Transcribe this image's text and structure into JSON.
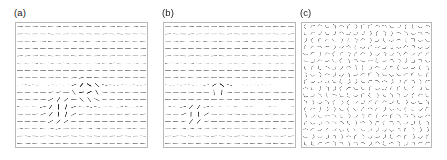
{
  "figure": {
    "type": "multi-panel-vector-field-figure",
    "width": 447,
    "height": 160,
    "background_color": "#ffffff",
    "panel_count": 3
  },
  "panels": [
    {
      "label": "(a)",
      "label_x": 14,
      "label_y": 7,
      "frame_x": 15,
      "frame_y": 22,
      "frame_w": 133,
      "frame_h": 126,
      "state": "ordered-nematic-with-defect-pair",
      "glyph": "dash",
      "base_angle_deg": 0,
      "angle_noise_deg": 7,
      "cols": 17,
      "rows": 17,
      "seed": 1741,
      "defects": [
        {
          "cx": 0.545,
          "cy": 0.525,
          "radius": 0.085,
          "strength": 78,
          "kind": "dark-cluster"
        },
        {
          "cx": 0.335,
          "cy": 0.7,
          "radius": 0.1,
          "strength": 62,
          "kind": "tilted-streak"
        }
      ]
    },
    {
      "label": "(b)",
      "label_x": 162,
      "label_y": 7,
      "frame_x": 163,
      "frame_y": 22,
      "frame_w": 133,
      "frame_h": 126,
      "state": "ordered-nematic-with-defect-pair",
      "glyph": "dash",
      "base_angle_deg": 0,
      "angle_noise_deg": 6,
      "cols": 17,
      "rows": 17,
      "seed": 9043,
      "defects": [
        {
          "cx": 0.425,
          "cy": 0.52,
          "radius": 0.055,
          "strength": 80,
          "kind": "dark-cluster"
        },
        {
          "cx": 0.235,
          "cy": 0.735,
          "radius": 0.075,
          "strength": 66,
          "kind": "tilted-streak"
        }
      ]
    },
    {
      "label": "(c)",
      "label_x": 300,
      "label_y": 7,
      "frame_x": 301,
      "frame_y": 22,
      "frame_w": 131,
      "frame_h": 126,
      "state": "disordered-isotropic",
      "glyph": "chevron",
      "base_angle_deg": null,
      "angle_noise_deg": 180,
      "cols": 18,
      "rows": 18,
      "seed": 2677,
      "defects": []
    }
  ],
  "style": {
    "frame_stroke": "#b9b9b9",
    "glyph_stroke": "#7a7a7a",
    "glyph_stroke_dark": "#2b2b2b",
    "label_color": "#1a1a1a",
    "background": "#ffffff"
  },
  "chart_data": {
    "type": "scatter",
    "title": "",
    "subtitle": "",
    "xlabel": "",
    "ylabel": "",
    "legend_position": "none",
    "grid": false,
    "panels": [
      {
        "name": "(a)",
        "order_parameter": 0.93,
        "glyph_count": 289,
        "defect_count": 2
      },
      {
        "name": "(b)",
        "order_parameter": 0.94,
        "glyph_count": 289,
        "defect_count": 2
      },
      {
        "name": "(c)",
        "order_parameter": 0.05,
        "glyph_count": 324,
        "defect_count": 0
      }
    ],
    "categories": [
      "(a)",
      "(b)",
      "(c)"
    ],
    "values": [
      0.93,
      0.94,
      0.05
    ]
  }
}
